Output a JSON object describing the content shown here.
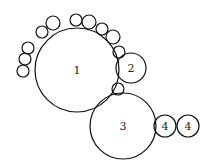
{
  "diagram": {
    "width": 211,
    "height": 164,
    "stroke_color": "#111111",
    "background": "#ffffff",
    "labeled_circles": [
      {
        "id": "c1",
        "label": "1",
        "cx": 77,
        "cy": 70,
        "r": 42
      },
      {
        "id": "c2",
        "label": "2",
        "cx": 131,
        "cy": 68,
        "r": 15
      },
      {
        "id": "c3",
        "label": "3",
        "cx": 123,
        "cy": 126,
        "r": 33
      },
      {
        "id": "c4a",
        "label": "4",
        "cx": 165,
        "cy": 126,
        "r": 11
      },
      {
        "id": "c4b",
        "label": "4",
        "cx": 188,
        "cy": 126,
        "r": 11
      }
    ],
    "small_circles": [
      {
        "cx": 23,
        "cy": 71,
        "r": 6
      },
      {
        "cx": 25,
        "cy": 59,
        "r": 6
      },
      {
        "cx": 28,
        "cy": 48,
        "r": 6
      },
      {
        "cx": 42,
        "cy": 32,
        "r": 6
      },
      {
        "cx": 53,
        "cy": 23,
        "r": 7
      },
      {
        "cx": 76,
        "cy": 20,
        "r": 6
      },
      {
        "cx": 89,
        "cy": 22,
        "r": 7
      },
      {
        "cx": 102,
        "cy": 29,
        "r": 6
      },
      {
        "cx": 113,
        "cy": 37,
        "r": 7
      },
      {
        "cx": 119,
        "cy": 52,
        "r": 6
      },
      {
        "cx": 118,
        "cy": 89,
        "r": 6
      }
    ]
  }
}
